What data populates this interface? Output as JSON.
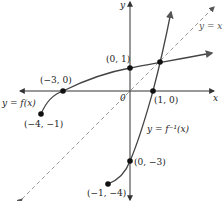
{
  "diagram": {
    "type": "function-and-inverse-graph",
    "axes": {
      "x_label": "x",
      "y_label": "y",
      "origin_label": "0"
    },
    "curves": [
      {
        "name": "f",
        "label": "y = f(x)"
      },
      {
        "name": "f_inverse",
        "label": "y = f⁻¹(x)"
      },
      {
        "name": "identity",
        "label": "y = x",
        "style": "dashed"
      }
    ],
    "points": [
      {
        "label": "(0, 1)",
        "x": 0,
        "y": 1
      },
      {
        "label": "(−3, 0)",
        "x": -3,
        "y": 0
      },
      {
        "label": "(−4, −1)",
        "x": -4,
        "y": -1
      },
      {
        "label": "(1, 0)",
        "x": 1,
        "y": 0
      },
      {
        "label": "(0, −3)",
        "x": 0,
        "y": -3
      },
      {
        "label": "(−1, −4)",
        "x": -1,
        "y": -4
      }
    ],
    "colors": {
      "axes": "#333333",
      "curve": "#444444",
      "dashed": "#999999",
      "text": "#222222"
    }
  }
}
